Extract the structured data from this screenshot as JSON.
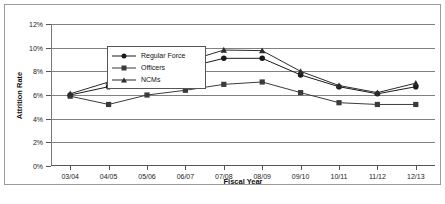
{
  "figure": {
    "caption": ""
  },
  "axes": {
    "ylabel": "Attrition Rate",
    "xlabel": "Fiscal Year",
    "yticks": [
      "0%",
      "2%",
      "4%",
      "6%",
      "8%",
      "10%",
      "12%"
    ]
  },
  "legend": {
    "items": [
      {
        "label": "Regular Force",
        "marker": "circle-marker",
        "color": "#1b1b1b"
      },
      {
        "label": "Officers",
        "marker": "square-marker",
        "color": "#3b3b3b"
      },
      {
        "label": "NCMs",
        "marker": "triangle-marker",
        "color": "#2b2b2b"
      }
    ]
  },
  "chart_data": {
    "type": "line",
    "title": "",
    "xlabel": "Fiscal Year",
    "ylabel": "Attrition Rate",
    "ylim": [
      0,
      12
    ],
    "ytick_step": 2,
    "ytick_suffix": "%",
    "grid": true,
    "legend_position": "upper-left-inside",
    "categories": [
      "03/04",
      "04/05",
      "05/06",
      "06/07",
      "07/08",
      "08/09",
      "09/10",
      "10/11",
      "11/12",
      "12/13"
    ],
    "series": [
      {
        "name": "Regular Force",
        "marker": "circle",
        "color": "#1b1b1b",
        "values": [
          6.0,
          6.7,
          6.9,
          8.3,
          9.1,
          9.1,
          7.7,
          6.7,
          6.1,
          6.7
        ]
      },
      {
        "name": "Officers",
        "marker": "square",
        "color": "#3b3b3b",
        "values": [
          5.9,
          5.2,
          6.0,
          6.4,
          6.9,
          7.1,
          6.2,
          5.35,
          5.2,
          5.2
        ]
      },
      {
        "name": "NCMs",
        "marker": "triangle",
        "color": "#2b2b2b",
        "values": [
          6.1,
          7.1,
          7.1,
          8.8,
          9.8,
          9.75,
          8.0,
          6.8,
          6.2,
          7.0
        ]
      }
    ]
  }
}
